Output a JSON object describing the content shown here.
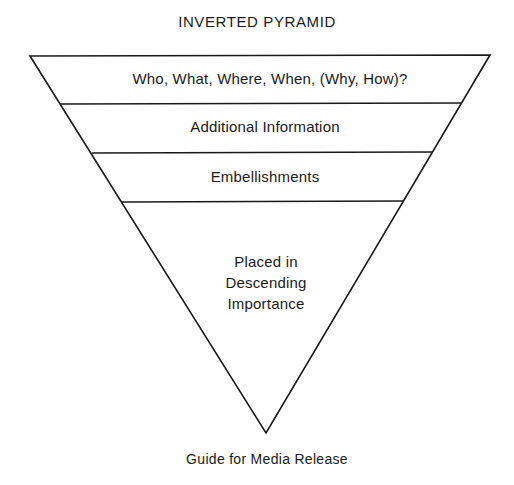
{
  "title": "INVERTED PYRAMID",
  "caption": "Guide for Media Release",
  "pyramid": {
    "line_color": "#1a1a1a",
    "layers": [
      {
        "label": "Who, What, Where, When, (Why, How)?"
      },
      {
        "label": "Additional Information"
      },
      {
        "label": "Embellishments"
      },
      {
        "label_lines": [
          "Placed in",
          "Descending",
          "Importance"
        ]
      }
    ]
  }
}
